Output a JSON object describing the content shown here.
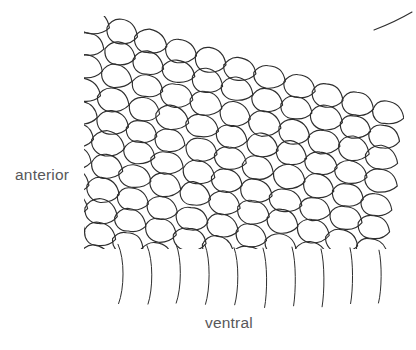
{
  "figure": {
    "kind": "scientific-line-drawing",
    "background_color": "#ffffff",
    "line_color": "#2e2e2e",
    "label_color": "#58585a",
    "labels": {
      "anterior": "anterior",
      "ventral": "ventral"
    },
    "scale_field": {
      "rows": 11,
      "cols": 11,
      "col_pitch_x": 29.5,
      "row_pitch_y": 22.6,
      "row_shift_x": -2.6,
      "col_shift_y": 9.2,
      "scale_width": 30,
      "scale_height": 23,
      "origin_x": 92,
      "origin_y": 22,
      "clip_left": 84,
      "clip_right": 404,
      "clip_top": 16,
      "clip_bottom": 249
    },
    "ventral_lines": {
      "count": 10,
      "top_y": 244,
      "bottom_y": 307,
      "start_x": [
        118,
        147,
        176,
        205,
        234,
        263,
        292,
        321,
        350,
        379
      ],
      "bow": 7
    },
    "top_right_stray_line": {
      "x1": 374,
      "y1": 30,
      "x2": 412,
      "y2": 12
    }
  }
}
